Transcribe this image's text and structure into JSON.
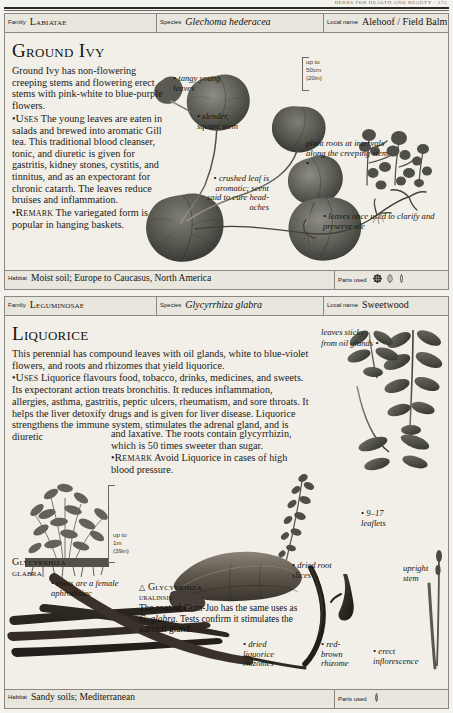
{
  "page": {
    "running_head": "HERBS FOR HEALTH AND BEAUTY  ·  175"
  },
  "articles": [
    {
      "id": "ground-ivy",
      "header": {
        "family_key": "Family",
        "family_value": "Labiatae",
        "species_key": "Species",
        "species_value": "Glechoma hederacea",
        "local_name_key": "Local name",
        "local_name_value": "Alehoof / Field Balm"
      },
      "title": "Ground Ivy",
      "body_runs": [
        {
          "text": "Ground Ivy has non-flowering creeping stems and flowering erect stems with pink-white to blue-purple flowers."
        },
        {
          "bullet": true,
          "keyword": "Uses",
          "text": " The young leaves are eaten in salads and brewed into aromatic Gill tea. This traditional blood cleanser, tonic, and diuretic is given for gastritis, kidney stones, cystitis, and tinnitus, and as an expectorant for chronic catarrh. The leaves reduce bruises and inflammation."
        },
        {
          "bullet": true,
          "keyword": "Remark",
          "text": " The variegated form is popular in hanging baskets."
        }
      ],
      "scale": {
        "line1": "up to",
        "line2": "50cm",
        "line3": "(20in)"
      },
      "annotations": [
        {
          "name": "tangy-young-leaves",
          "text": "tangy young leaves"
        },
        {
          "name": "slender-square-stem",
          "text": "slender, square stem"
        },
        {
          "name": "crushed-leaf-aromatic",
          "text": "crushed leaf is aromatic; scent said to cure head-aches"
        },
        {
          "name": "plant-roots-intervals",
          "text": "plant roots at intervals along the creeping stem"
        },
        {
          "name": "leaves-clarify-ale",
          "text": "leaves once used to clarify and preserve ale"
        }
      ],
      "footer": {
        "habitat_key": "Habitat",
        "habitat_value": "Moist soil; Europe to Caucasus, North America",
        "parts_key": "Parts used",
        "parts_icons": [
          "flower-icon",
          "leaf-icon",
          "stem-icon"
        ]
      }
    },
    {
      "id": "liquorice",
      "header": {
        "family_key": "Family",
        "family_value": "Leguminosae",
        "species_key": "Species",
        "species_value": "Glycyrrhiza glabra",
        "local_name_key": "Local name",
        "local_name_value": "Sweetwood"
      },
      "title": "Liquorice",
      "body_runs": [
        {
          "text": "This perennial has compound leaves with oil glands, white to blue-violet flowers, and roots and rhizomes that yield liquorice."
        },
        {
          "bullet": true,
          "keyword": "Uses",
          "text": " Liquorice flavours food, tobacco, drinks, medicines, and sweets. Its expectorant action treats bronchitis. It reduces inflammation, allergies, asthma, gastritis, peptic ulcers, rheumatism, and sore throats. It helps the liver detoxify drugs and is given for liver disease. Liquorice strengthens the immune system, stimulates the adrenal gland, and is diuretic"
        }
      ],
      "body_runs2": [
        {
          "text": "and laxative. The roots contain glycyrrhizin, which is 50 times sweeter than sugar."
        },
        {
          "bullet": true,
          "keyword": "Remark",
          "text": " Avoid Liquorice in cases of high blood pressure."
        }
      ],
      "scale": {
        "line1": "up to",
        "line2": "1m",
        "line3": "(39in)"
      },
      "captions": [
        {
          "name": "glycyrrhiza-glabra",
          "title_line1": "Glycyrrhiza",
          "title_line2": "glabra"
        },
        {
          "name": "glycyrrhiza-uralinsis",
          "triangle": "△",
          "title_line1": "Glycyrrhiza",
          "title_line2": "uralinsis",
          "text_a": "The root of Gum-Juo has the same uses as ",
          "text_italic": "G. glabra",
          "text_b": ". Tests confirm it stimulates the adrenal gland."
        }
      ],
      "annotations": [
        {
          "name": "leaves-sticky-oil-glands",
          "text": "leaves sticky from oil glands"
        },
        {
          "name": "nine-seventeen-leaflets",
          "text": "9–17 leaflets"
        },
        {
          "name": "upright-stem",
          "text": "upright stem"
        },
        {
          "name": "roots-female-aphrodisiac",
          "text": "roots are a female aphrodisiac"
        },
        {
          "name": "dried-root-slices",
          "text": "dried root slices"
        },
        {
          "name": "dried-liquorice-rhizomes",
          "text": "dried liquorice rhizomes"
        },
        {
          "name": "red-brown-rhizome",
          "text": "red-brown rhizome"
        },
        {
          "name": "erect-inflorescence",
          "text": "erect inflorescence"
        }
      ],
      "footer": {
        "habitat_key": "Habitat",
        "habitat_value": "Sandy soils; Mediterranean",
        "parts_key": "Parts used",
        "parts_icons": [
          "root-icon"
        ]
      }
    }
  ],
  "colors": {
    "page_bg": "#f4f2ec",
    "panel_bg": "#f2efe8",
    "strip_bg": "#e9e6de",
    "rule": "#8a8880",
    "ink": "#16150f",
    "plant_dark": "#4a4a45",
    "plant_mid": "#6d6d66",
    "root_brown": "#3b332c"
  }
}
